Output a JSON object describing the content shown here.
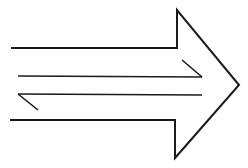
{
  "diagram": {
    "colors": {
      "background": "#ffffff",
      "stroke": "#1a1a1a"
    },
    "outer_arrow": {
      "direction": "right",
      "points": [
        [
          11,
          48
        ],
        [
          177,
          48
        ],
        [
          177,
          10
        ],
        [
          239,
          85
        ],
        [
          175,
          158
        ],
        [
          175,
          120
        ],
        [
          10,
          120
        ]
      ],
      "stroke_width": 2
    },
    "inner_lines": [
      {
        "name": "upper-half-arrow",
        "direction": "right",
        "shaft": [
          [
            18,
            76
          ],
          [
            202,
            77
          ]
        ],
        "barb": [
          [
            182,
            60
          ],
          [
            202,
            77
          ]
        ],
        "stroke_width": 1.6
      },
      {
        "name": "lower-half-arrow",
        "direction": "left",
        "shaft": [
          [
            202,
            95
          ],
          [
            18,
            94
          ]
        ],
        "barb": [
          [
            18,
            94
          ],
          [
            38,
            110
          ]
        ],
        "stroke_width": 1.6
      }
    ]
  }
}
